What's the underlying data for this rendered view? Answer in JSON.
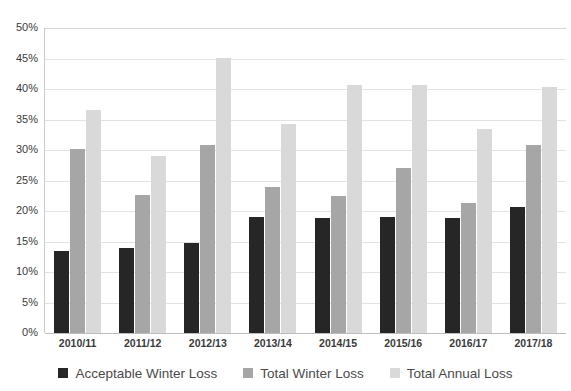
{
  "chart_data": {
    "type": "bar",
    "title": "",
    "xlabel": "",
    "ylabel": "",
    "ylim": [
      0,
      50
    ],
    "ytick_step": 5,
    "grid": true,
    "legend_position": "bottom",
    "ytick_labels": [
      "50%",
      "45%",
      "40%",
      "35%",
      "30%",
      "25%",
      "20%",
      "15%",
      "10%",
      "5%",
      "0%"
    ],
    "ytick_values": [
      50,
      45,
      40,
      35,
      30,
      25,
      20,
      15,
      10,
      5,
      0
    ],
    "categories": [
      "2010/11",
      "2011/12",
      "2012/13",
      "2013/14",
      "2014/15",
      "2015/16",
      "2016/17",
      "2017/18"
    ],
    "series": [
      {
        "name": "Acceptable Winter Loss",
        "color": "#262626",
        "values": [
          13.4,
          13.9,
          14.8,
          19.1,
          18.8,
          19.1,
          18.8,
          20.6
        ]
      },
      {
        "name": "Total Winter Loss",
        "color": "#a6a6a6",
        "values": [
          30.1,
          22.6,
          30.8,
          23.9,
          22.4,
          27.1,
          21.3,
          30.9
        ]
      },
      {
        "name": "Total Annual Loss",
        "color": "#d9d9d9",
        "values": [
          36.6,
          29.0,
          45.1,
          34.3,
          40.6,
          40.6,
          33.5,
          40.3
        ]
      }
    ]
  },
  "legend": {
    "items": [
      {
        "label": "Acceptable Winter Loss"
      },
      {
        "label": "Total Winter Loss"
      },
      {
        "label": "Total Annual Loss"
      }
    ]
  }
}
